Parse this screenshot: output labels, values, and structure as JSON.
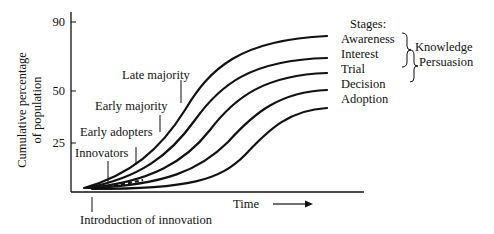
{
  "diagram": {
    "y_axis": {
      "label_line1": "Cumulative percentage",
      "label_line2": "of population",
      "ticks": [
        {
          "value": "90",
          "y": 22
        },
        {
          "value": "50",
          "y": 91
        },
        {
          "value": "25",
          "y": 143
        }
      ]
    },
    "x_axis": {
      "label": "Time",
      "arrow": "right-arrow"
    },
    "origin_label": "Introduction of innovation",
    "adopter_labels": [
      {
        "text": "Innovators"
      },
      {
        "text": "Early adopters"
      },
      {
        "text": "Early majority"
      },
      {
        "text": "Late majority"
      }
    ],
    "stages": {
      "title": "Stages:",
      "items": [
        "Awareness",
        "Interest",
        "Trial",
        "Decision",
        "Adoption"
      ],
      "groups": [
        {
          "label": "Knowledge",
          "covers": [
            "Awareness",
            "Interest"
          ]
        },
        {
          "label": "Persuasion",
          "covers": [
            "Interest",
            "Trial"
          ]
        }
      ]
    },
    "curves": [
      {
        "name": "Awareness",
        "end_y": 36
      },
      {
        "name": "Interest",
        "end_y": 58
      },
      {
        "name": "Trial",
        "end_y": 73
      },
      {
        "name": "Decision",
        "end_y": 90
      },
      {
        "name": "Adoption",
        "end_y": 108
      }
    ]
  }
}
